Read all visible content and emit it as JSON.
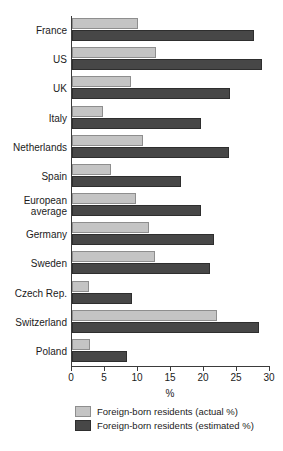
{
  "chart_data": {
    "type": "bar",
    "orientation": "horizontal",
    "title": "",
    "xlabel": "%",
    "ylabel": "",
    "xlim": [
      0,
      30
    ],
    "xticks": [
      0,
      5,
      10,
      15,
      20,
      25,
      30
    ],
    "grid": false,
    "legend_position": "bottom",
    "categories": [
      "France",
      "US",
      "UK",
      "Italy",
      "Netherlands",
      "Spain",
      "European\naverage",
      "Germany",
      "Sweden",
      "Czech Rep.",
      "Switzerland",
      "Poland"
    ],
    "series": [
      {
        "name": "Foreign-born residents (actual %)",
        "color": "#c4c4c4",
        "values": [
          10.0,
          12.7,
          8.9,
          4.7,
          10.7,
          5.9,
          9.7,
          11.7,
          12.6,
          2.5,
          21.9,
          2.7
        ]
      },
      {
        "name": "Foreign-born residents (estimated %)",
        "color": "#474747",
        "values": [
          27.6,
          28.8,
          24.0,
          19.6,
          23.8,
          16.5,
          19.6,
          21.5,
          20.9,
          9.1,
          28.3,
          8.3
        ]
      }
    ]
  },
  "legend": {
    "items": [
      {
        "label": "Foreign-born residents (actual %)",
        "swatch": "actual"
      },
      {
        "label": "Foreign-born residents (estimated %)",
        "swatch": "estimated"
      }
    ]
  },
  "axis": {
    "x_title": "%"
  }
}
